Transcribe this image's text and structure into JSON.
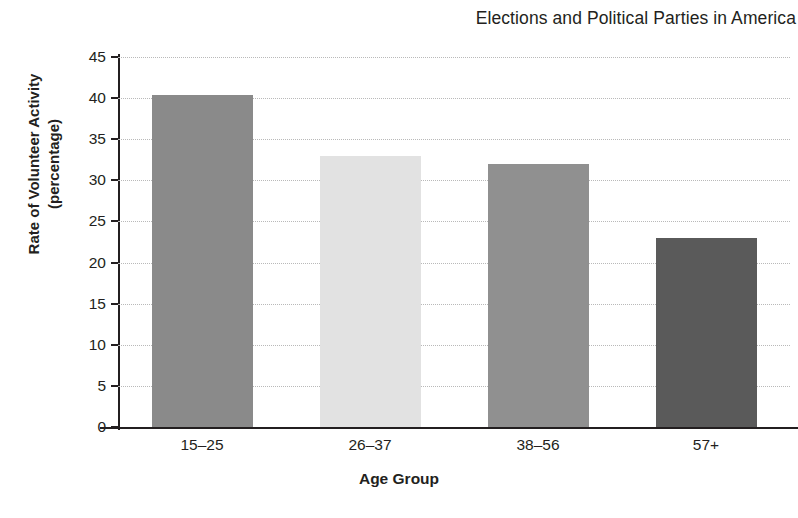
{
  "chart_data": {
    "type": "bar",
    "title": "Elections and Political Parties in America",
    "xlabel": "Age Group",
    "ylabel": "Rate of Volunteer Activity",
    "ylabel_line2": "(percentage)",
    "categories": [
      "15–25",
      "26–37",
      "38–56",
      "57+"
    ],
    "values": [
      40.4,
      33,
      32,
      23
    ],
    "ylim": [
      0,
      45
    ],
    "ytick_step": 5,
    "yticks": [
      "45",
      "40",
      "35",
      "30",
      "25",
      "20",
      "15",
      "10",
      "5",
      "0"
    ],
    "ytick_values": [
      45,
      40,
      35,
      30,
      25,
      20,
      15,
      10,
      5,
      0
    ],
    "grid": true,
    "grid_style": "dotted",
    "legend": "none",
    "bar_colors": [
      "#8a8a8a",
      "#e2e2e2",
      "#909090",
      "#5a5a5a"
    ],
    "series": [
      {
        "name": "Rate of Volunteer Activity",
        "values": [
          40.4,
          33,
          32,
          23
        ]
      }
    ],
    "background_color": "#ffffff",
    "axis_color": "#231f20",
    "gridline_color": "#b9b9b9"
  }
}
